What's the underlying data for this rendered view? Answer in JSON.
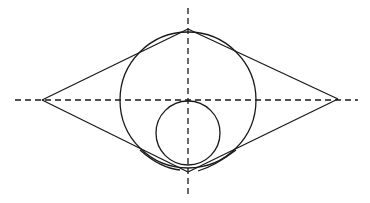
{
  "diagram": {
    "colors": {
      "stroke": "#1a1a1a",
      "background": "#ffffff"
    },
    "axes": {
      "horizontal": {
        "y": 100,
        "x1": 15,
        "x2": 358
      },
      "vertical": {
        "x": 188,
        "y1": 8,
        "y2": 195
      }
    },
    "large_circle": {
      "cx": 188,
      "cy": 100,
      "r": 68
    },
    "small_circle": {
      "cx": 188,
      "cy": 133,
      "r": 32
    },
    "left_point": {
      "x": 42,
      "y": 100
    },
    "right_point": {
      "x": 338,
      "y": 99
    },
    "top_apex": {
      "x": 188,
      "y": 29
    },
    "bottom_apex": {
      "x": 188,
      "y": 172
    }
  }
}
